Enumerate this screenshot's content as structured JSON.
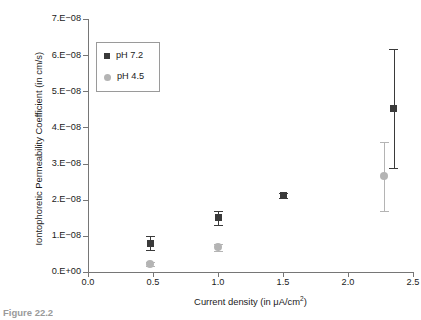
{
  "figure": {
    "caption": "Figure 22.2"
  },
  "legend": {
    "position": "top-left-inside",
    "entries": [
      {
        "label": "pH 7.2",
        "marker": "square-marker",
        "color": "#3a3a3a"
      },
      {
        "label": "pH 4.5",
        "marker": "circle-marker",
        "color": "#b4b4b4"
      }
    ]
  },
  "chart_data": {
    "type": "scatter",
    "title": "",
    "xlabel": "Current density (in μA/cm²)",
    "ylabel": "Iontophoretic Permeability Coefficient (in cm/s)",
    "xlim": [
      0.0,
      2.5
    ],
    "ylim": [
      0.0,
      7e-08
    ],
    "grid": false,
    "legend_position": "upper left",
    "xticks": [
      0.0,
      0.5,
      1.0,
      1.5,
      2.0,
      2.5
    ],
    "xtick_labels": [
      "0.0",
      "0.5",
      "1.0",
      "1.5",
      "2.0",
      "2.5"
    ],
    "yticks": [
      0.0,
      1e-08,
      2e-08,
      3e-08,
      4e-08,
      5e-08,
      6e-08,
      7e-08
    ],
    "ytick_labels": [
      "0.E+00",
      "1.E−08",
      "2.E−08",
      "3.E−08",
      "4.E−08",
      "5.E−08",
      "6.E−08",
      "7.E−08"
    ],
    "series": [
      {
        "name": "pH 7.2",
        "marker": "square",
        "color": "#3a3a3a",
        "x": [
          0.48,
          1.0,
          1.5,
          2.35
        ],
        "y": [
          8e-09,
          1.5e-08,
          2.12e-08,
          4.52e-08
        ],
        "yerr": [
          2e-09,
          2e-09,
          7e-10,
          1.65e-08
        ]
      },
      {
        "name": "pH 4.5",
        "marker": "circle",
        "color": "#b4b4b4",
        "x": [
          0.48,
          1.0,
          2.28
        ],
        "y": [
          2.2e-09,
          6.8e-09,
          2.65e-08
        ],
        "yerr": [
          6e-10,
          1e-09,
          9.5e-09
        ]
      }
    ]
  }
}
